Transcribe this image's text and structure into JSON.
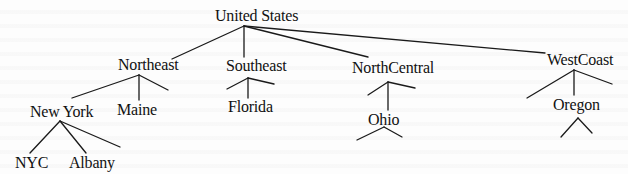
{
  "diagram": {
    "type": "tree",
    "title": "United States",
    "nodes": {
      "root": {
        "label": "United States"
      },
      "northeast": {
        "label": "Northeast"
      },
      "southeast": {
        "label": "Southeast"
      },
      "northcentral": {
        "label": "NorthCentral"
      },
      "westcoast": {
        "label": "WestCoast"
      },
      "newyork": {
        "label": "New York"
      },
      "maine": {
        "label": "Maine"
      },
      "florida": {
        "label": "Florida"
      },
      "ohio": {
        "label": "Ohio"
      },
      "oregon": {
        "label": "Oregon"
      },
      "nyc": {
        "label": "NYC"
      },
      "albany": {
        "label": "Albany"
      }
    },
    "edges": [
      [
        "United States",
        "Northeast"
      ],
      [
        "United States",
        "Southeast"
      ],
      [
        "United States",
        "NorthCentral"
      ],
      [
        "United States",
        "WestCoast"
      ],
      [
        "Northeast",
        "New York"
      ],
      [
        "Northeast",
        "Maine"
      ],
      [
        "Northeast",
        "(unlabeled)"
      ],
      [
        "Southeast",
        "(unlabeled)"
      ],
      [
        "Southeast",
        "Florida"
      ],
      [
        "Southeast",
        "(unlabeled)"
      ],
      [
        "NorthCentral",
        "(unlabeled)"
      ],
      [
        "NorthCentral",
        "Ohio"
      ],
      [
        "NorthCentral",
        "(unlabeled)"
      ],
      [
        "WestCoast",
        "(unlabeled)"
      ],
      [
        "WestCoast",
        "Oregon"
      ],
      [
        "WestCoast",
        "(unlabeled)"
      ],
      [
        "New York",
        "NYC"
      ],
      [
        "New York",
        "Albany"
      ],
      [
        "New York",
        "(unlabeled)"
      ],
      [
        "Ohio",
        "(unlabeled)"
      ],
      [
        "Ohio",
        "(unlabeled)"
      ],
      [
        "Oregon",
        "(unlabeled)"
      ],
      [
        "Oregon",
        "(unlabeled)"
      ]
    ],
    "colors": {
      "line": "#1a1a1a",
      "text": "#111111",
      "background": "#fdfdfd"
    }
  }
}
